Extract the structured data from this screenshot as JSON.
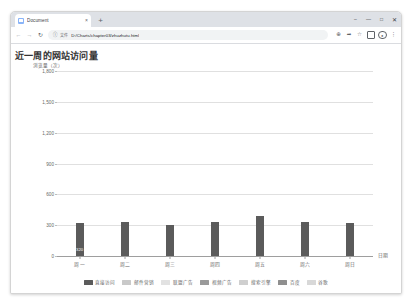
{
  "browser": {
    "tab": {
      "title": "Document",
      "close_label": "×",
      "favicon": "page-icon"
    },
    "new_tab_label": "+",
    "window_controls": {
      "minimize": "–",
      "maximize": "□",
      "close": "✕",
      "restore": "—"
    },
    "nav": {
      "back": "←",
      "forward": "→",
      "reload": "↻"
    },
    "omnibox": {
      "security_icon": "info-icon",
      "chip": "文件",
      "url": "D:/Charts/chapter03/zhuzhutu.html"
    },
    "toolbar_right": {
      "zoom": "⊕",
      "share": "share-icon",
      "bookmark": "☆",
      "extensions": "extensions-icon",
      "profile": "●",
      "menu": "⋮"
    }
  },
  "chart_data": {
    "type": "bar",
    "title": "近一周的网站访问量",
    "xlabel": "日期",
    "ylabel": "浏览量（次）",
    "categories": [
      "周一",
      "周二",
      "周三",
      "周四",
      "周五",
      "周六",
      "周日"
    ],
    "values": [
      320,
      332,
      301,
      334,
      390,
      330,
      320
    ],
    "bar_labels": [
      "320",
      "",
      "",
      "",
      "",
      "",
      ""
    ],
    "ylim": [
      0,
      1800
    ],
    "yticks": [
      "0",
      "300",
      "600",
      "900",
      "1,200",
      "1,500",
      "1,800"
    ],
    "ytick_values": [
      0,
      300,
      600,
      900,
      1200,
      1500,
      1800
    ],
    "grid": true,
    "legend_position": "bottom",
    "bar_color": "#5b5b5b",
    "legend": [
      {
        "label": "直接访问",
        "color": "#5b5b5b"
      },
      {
        "label": "邮件营销",
        "color": "#c9c9c9"
      },
      {
        "label": "联盟广告",
        "color": "#e2e2e2"
      },
      {
        "label": "视频广告",
        "color": "#9a9a9a"
      },
      {
        "label": "搜索引擎",
        "color": "#cfcfcf"
      },
      {
        "label": "百度",
        "color": "#8f8f8f"
      },
      {
        "label": "谷歌",
        "color": "#d8d8d8"
      }
    ]
  }
}
